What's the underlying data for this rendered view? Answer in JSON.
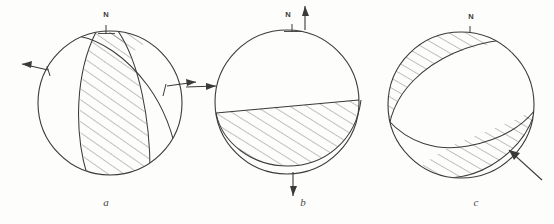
{
  "figure": {
    "type": "diagram",
    "panel_count": 3,
    "stroke_color": "#3a3a3a",
    "hatch_color": "#555555",
    "background_color": "#fdfdfc"
  },
  "panels": [
    {
      "id": "a",
      "label": "a",
      "north_label": "N",
      "mechanism": "strike-slip / oblique with steeply dipping nodal planes",
      "shaded_regions": 2,
      "arrows": [
        {
          "name": "left-arrow",
          "direction": "outward-left",
          "position": "west"
        },
        {
          "name": "right-arrow",
          "direction": "outward-right",
          "position": "east"
        }
      ]
    },
    {
      "id": "b",
      "label": "b",
      "north_label": "N",
      "mechanism": "dip-slip with shallow-dipping nodal plane",
      "shaded_regions": 1,
      "arrows": [
        {
          "name": "top-arrow",
          "direction": "up",
          "position": "north"
        },
        {
          "name": "bottom-arrow",
          "direction": "down",
          "position": "south"
        },
        {
          "name": "left-arrow",
          "direction": "inward-right",
          "position": "west"
        }
      ]
    },
    {
      "id": "c",
      "label": "c",
      "north_label": "N",
      "mechanism": "oblique-slip with two opposing shaded quadrants",
      "shaded_regions": 2,
      "arrows": [
        {
          "name": "lower-right-arrow",
          "direction": "inward-up-left",
          "position": "southeast"
        }
      ]
    }
  ]
}
